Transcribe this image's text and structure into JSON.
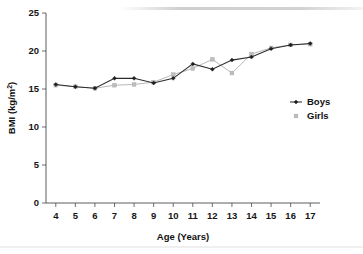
{
  "chart_data": {
    "type": "line",
    "title": "",
    "xlabel": "Age (Years)",
    "ylabel": "BMI (kg/m²)",
    "ylabel_base": "BMI (kg/m",
    "ylabel_sup": "2",
    "ylabel_tail": ")",
    "x": [
      4,
      5,
      6,
      7,
      8,
      9,
      10,
      11,
      12,
      13,
      14,
      15,
      16,
      17
    ],
    "categories": [
      "4",
      "5",
      "6",
      "7",
      "8",
      "9",
      "10",
      "11",
      "12",
      "13",
      "14",
      "15",
      "16",
      "17"
    ],
    "xlim": [
      3.5,
      17.5
    ],
    "ylim": [
      0,
      25
    ],
    "yticks": [
      0,
      5,
      10,
      15,
      20,
      25
    ],
    "ytick_labels": [
      "0",
      "5",
      "10",
      "15",
      "20",
      "25"
    ],
    "grid": false,
    "legend_position": "right",
    "series": [
      {
        "name": "Boys",
        "color": "#2b2b2b",
        "marker": "diamond",
        "values": [
          15.6,
          15.3,
          15.1,
          16.4,
          16.4,
          15.8,
          16.4,
          18.3,
          17.6,
          18.8,
          19.2,
          20.3,
          20.8,
          21.0
        ]
      },
      {
        "name": "Girls",
        "color": "#bdbdbd",
        "marker": "square",
        "values": [
          15.5,
          15.3,
          15.1,
          15.5,
          15.6,
          15.9,
          16.9,
          17.7,
          18.9,
          17.1,
          19.6,
          20.4,
          20.8,
          20.9
        ]
      }
    ]
  },
  "legend": {
    "items": [
      {
        "label": "Boys"
      },
      {
        "label": "Girls"
      }
    ]
  }
}
